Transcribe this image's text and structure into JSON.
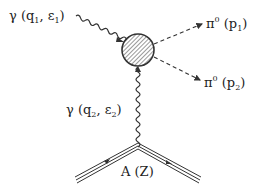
{
  "diagram": {
    "type": "feynman",
    "labels": {
      "photon1": {
        "symbol": "γ",
        "momentum": "q",
        "momentum_idx": "1",
        "pol": "ε",
        "pol_idx": "1"
      },
      "photon2": {
        "symbol": "γ",
        "momentum": "q",
        "momentum_idx": "2",
        "pol": "ε",
        "pol_idx": "2"
      },
      "pion1": {
        "symbol": "π",
        "charge": "0",
        "momentum": "p",
        "momentum_idx": "1"
      },
      "pion2": {
        "symbol": "π",
        "charge": "0",
        "momentum": "p",
        "momentum_idx": "2"
      },
      "nucleus": "A (Z)"
    },
    "colors": {
      "line": "#333333",
      "hatch": "#555555"
    }
  }
}
